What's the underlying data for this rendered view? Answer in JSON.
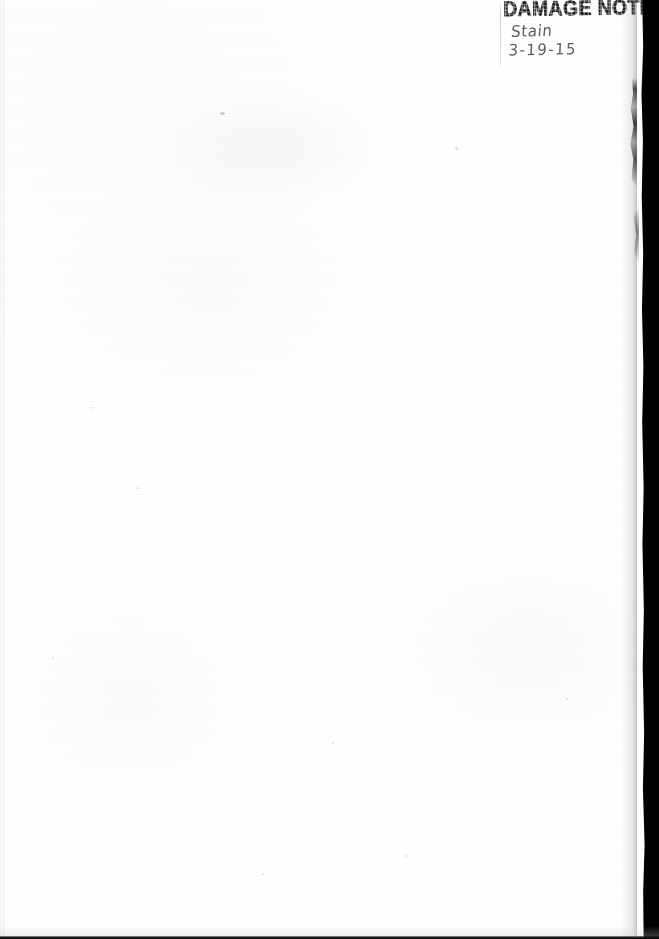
{
  "document": {
    "type": "scanned-page",
    "page_state": "blank",
    "background_color": "#ffffff"
  },
  "annotation": {
    "stamp_label": "DAMAGE NOTE",
    "stamp_color": "#1b1b1d",
    "stamp_clipped_at_right_edge": true,
    "handwritten_note": "Stain",
    "handwritten_date": "3-19-15",
    "handwriting_color": "#46464a"
  },
  "scan_artifacts": {
    "right_edge_band_color": "#000000",
    "bottom_edge_line_color": "#141416",
    "left_edge_line_color": "#cdcdd0"
  }
}
